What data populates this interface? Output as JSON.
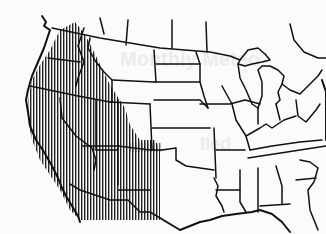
{
  "map": {
    "subject": "Continental United States outline map with state boundaries",
    "shaded_region": {
      "pattern": "vertical-hatching",
      "color": "#111111",
      "covers": "Western United States (Pacific coast, Great Basin, Southwest)"
    },
    "background_color": "#fbfbfa",
    "line_color": "#111111",
    "bleed_through_text": [
      "Monthly Meteo",
      "lled"
    ]
  }
}
